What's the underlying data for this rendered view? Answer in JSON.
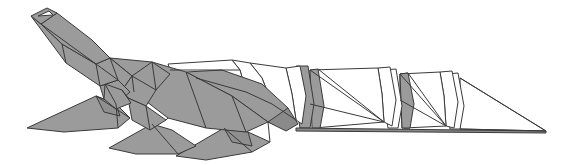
{
  "figure": {
    "title": "Origami Crocodile",
    "subject": "crocodile",
    "style": "flat-shaded polygonal origami illustration",
    "canvas": {
      "width": 566,
      "height": 165,
      "background": "#ffffff"
    },
    "palette": {
      "paper_front": "#9b9b9b",
      "paper_back": "#ffffff",
      "paper_shadow": "#8a8a8a",
      "crease_line": "#3a3a3a",
      "background": "#ffffff"
    },
    "line_width": 1,
    "parts": [
      {
        "name": "snout-tip",
        "fill": "paper_front"
      },
      {
        "name": "upper-jaw",
        "fill": "paper_front"
      },
      {
        "name": "neck",
        "fill": "paper_front"
      },
      {
        "name": "front-leg",
        "fill": "paper_front"
      },
      {
        "name": "hind-leg",
        "fill": "paper_front"
      },
      {
        "name": "torso",
        "fill": "paper_front"
      },
      {
        "name": "dorsal-plates",
        "fill": "paper_back"
      },
      {
        "name": "tail-segments",
        "fill": "paper_back"
      },
      {
        "name": "tail-tip",
        "fill": "paper_back"
      }
    ]
  },
  "geometry": {
    "snout_tip_outer": "31,16 47,8 57,13 41,24",
    "snout_tip_inner": "38,16 49,11 53,15",
    "head_upper": "41,24 57,13 92,40 110,58 96,64 62,44",
    "head_lower": "31,16 41,24 62,44 96,64 118,80 100,86 66,63",
    "neck_left": "96,64 110,58 132,76 122,90 105,84",
    "neck_gusset": "100,86 118,80 130,92 116,104 104,99",
    "jaw_plate": "105,84 122,90 131,103 116,109 104,99",
    "front_leg": "27,128 96,96 116,104 130,118 118,128 64,132",
    "front_leg_shadow": "96,96 116,104 120,116 104,112",
    "chest": "110,58 132,76 152,62 170,74 156,90 134,92",
    "shoulder_fold": "132,76 156,90 146,106 128,98 122,90",
    "body_upper": "110,58 134,92 168,118 206,128 246,132 268,122 232,96 186,72 152,62",
    "body_front_panel": "128,98 146,106 166,120 150,130 132,120",
    "mid_leg": "109,148 152,124 172,130 196,146 178,154 136,154",
    "hind_leg": "176,156 224,128 248,132 270,142 252,152 206,160",
    "hind_leg_shadow": "224,128 248,132 252,146 232,142",
    "haunch": "186,72 232,96 268,122 284,128 288,108 262,84 222,70",
    "hip_wedge": "268,122 288,108 298,124 286,131",
    "dorsal_plate_1": "168,64 232,60 240,70 246,92 196,78 170,70",
    "dorsal_plate_2": "232,60 250,63 262,78 272,104 246,92 240,70",
    "dorsal_plate_3": "250,63 286,68 292,94 296,120 272,104 262,78",
    "dorsal_plate_4": "286,68 300,66 306,96 302,124 296,120 292,94",
    "hip_shadow": "296,66 308,66 314,104 310,128 300,128 296,104",
    "tail_seg_1_white": "310,70 378,68 382,94 384,122 314,128 310,104",
    "tail_seg_1_shadow": "310,70 318,69 324,106 320,128 312,128",
    "tail_seg_2_white": "378,68 390,67 396,100 392,126 384,122 382,94",
    "tail_seg_2_shade": "384,70 396,69 402,106 398,128 388,128 384,104",
    "tail_seg_3_white": "400,74 440,72 444,96 446,126 404,128 400,100",
    "tail_seg_3_shadow": "400,74 408,73 414,104 410,128 402,128",
    "tail_seg_4_white": "440,72 452,71 458,102 454,128 446,126 444,96",
    "tail_seg_4_shade": "446,74 458,73 464,106 460,129 450,129 446,104",
    "tail_tip": "460,78 546,131 460,129",
    "ground_shadow": "296,128 546,131 546,133 296,131"
  },
  "creases": [
    "41,24 96,64",
    "62,44 66,63",
    "96,64 100,86",
    "110,58 118,80",
    "118,80 130,92",
    "105,84 116,104",
    "122,90 128,98",
    "132,76 134,92",
    "96,96 130,118",
    "116,104 118,128",
    "152,62 156,90",
    "146,106 150,130",
    "168,118 166,120",
    "186,72 206,128",
    "232,96 246,132",
    "152,124 178,154",
    "224,128 252,152",
    "268,122 270,142",
    "170,70 240,70",
    "196,78 246,92",
    "246,92 272,104",
    "272,104 296,120",
    "310,104 384,122",
    "310,70 384,122",
    "318,69 384,122",
    "400,100 446,126",
    "400,74 446,126",
    "408,73 446,126",
    "460,78 546,131",
    "460,129 546,131"
  ]
}
